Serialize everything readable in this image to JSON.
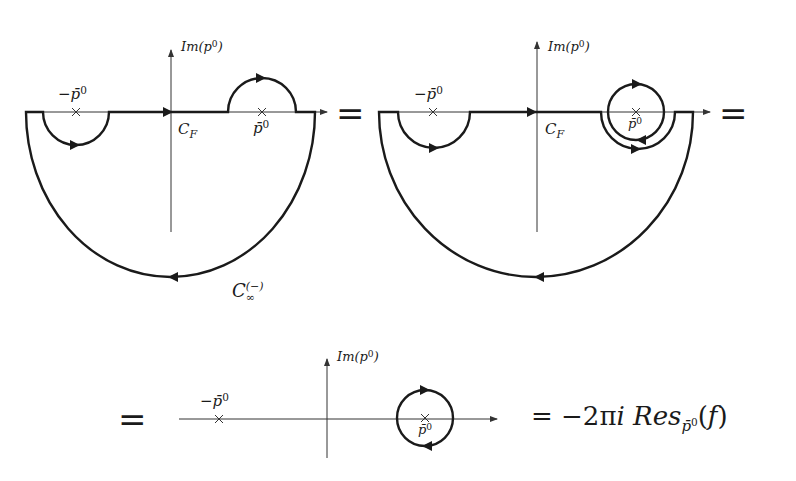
{
  "figure": {
    "colors": {
      "ink": "#1a1a1a",
      "axis": "#333333",
      "background": "#ffffff"
    },
    "panels": [
      {
        "id": "panel-1",
        "axis_label": "Im(p",
        "axis_label_sup": "0",
        "axis_label_close": ")",
        "left_pole_label": "−p̄",
        "left_pole_sup": "0",
        "right_pole_label": "p̄",
        "right_pole_sup": "0",
        "contour_label": "C",
        "contour_label_sub": "F",
        "closing_contour_label": "C",
        "closing_contour_sub": "∞",
        "closing_contour_sup": "(−)"
      },
      {
        "id": "panel-2",
        "axis_label": "Im(p",
        "axis_label_sup": "0",
        "axis_label_close": ")",
        "left_pole_label": "−p̄",
        "left_pole_sup": "0",
        "right_pole_label": "p̄",
        "right_pole_sup": "0",
        "contour_label": "C",
        "contour_label_sub": "F"
      },
      {
        "id": "panel-3",
        "axis_label": "Im(p",
        "axis_label_sup": "0",
        "axis_label_close": ")",
        "left_pole_label": "−p̄",
        "left_pole_sup": "0",
        "right_pole_label": "p̄",
        "right_pole_sup": "0"
      }
    ],
    "equals_sign": "=",
    "result": {
      "prefix": "= −2π",
      "i": "i",
      "res": "Res",
      "res_sub": "p̄",
      "res_sub_sup": "0",
      "arg": "(",
      "f": "f",
      "close": ")"
    }
  }
}
